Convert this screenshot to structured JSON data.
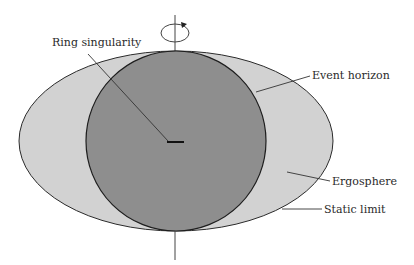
{
  "diagram": {
    "labels": {
      "ring_singularity": "Ring singularity",
      "event_horizon": "Event horizon",
      "ergosphere": "Ergosphere",
      "static_limit": "Static limit"
    },
    "colors": {
      "ergosphere_fill": "#d2d2d2",
      "horizon_fill": "#8e8e8e",
      "outline": "#2b2b2b",
      "background": "#ffffff"
    },
    "icons": {
      "rotation": "rotation-arrow-icon"
    }
  }
}
